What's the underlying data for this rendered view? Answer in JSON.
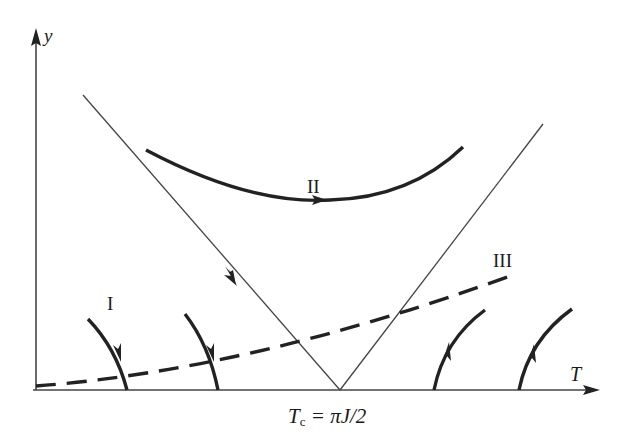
{
  "diagram": {
    "axes": {
      "y_label": "y",
      "x_label": "T",
      "critical_label": "Tᴄ = πJ/2",
      "critical_T_main": "T",
      "critical_T_sub": "c",
      "critical_rest": "= πJ/2"
    },
    "flow_labels": {
      "region_I": "I",
      "region_II": "II",
      "region_III": "III"
    },
    "colors": {
      "stroke": "#222222",
      "thin_line": "#444444",
      "background": "#ffffff"
    },
    "elements": [
      {
        "name": "separatrix-left",
        "description": "thin line from upper-left down to Tc on T axis, arrow pointing toward Tc"
      },
      {
        "name": "separatrix-right",
        "description": "thin line from Tc up to upper-right"
      },
      {
        "name": "flow-II",
        "description": "thick curve above the V, arrow pointing right at its minimum"
      },
      {
        "name": "flow-III",
        "description": "thick dashed curve rising from origin to the right"
      },
      {
        "name": "flow-I",
        "description": "two thick curves on the left flowing down toward the T axis"
      },
      {
        "name": "flow-right",
        "description": "two thick curves on the right flowing up away from the T axis"
      }
    ]
  }
}
